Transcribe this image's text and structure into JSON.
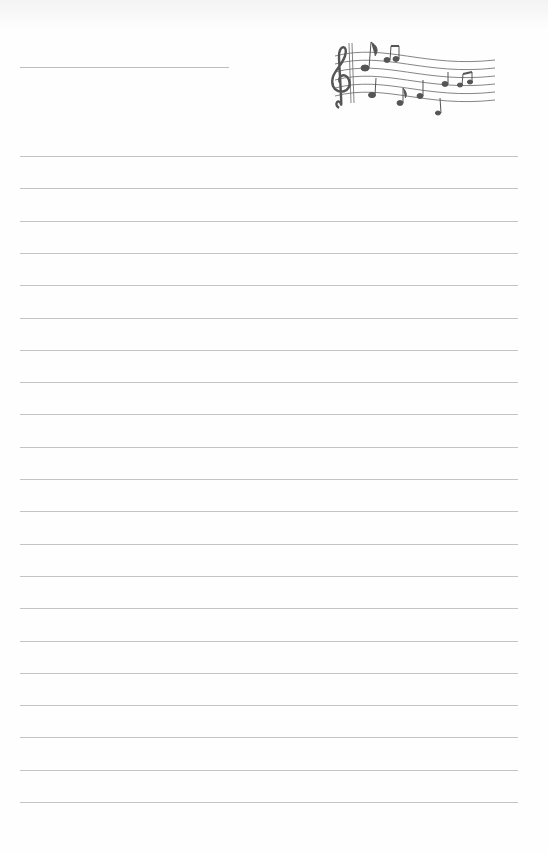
{
  "document": {
    "type": "lined-writing-paper",
    "decoration": "music-staff-with-notes-icon",
    "name_line": true,
    "rule_count": 21,
    "rule_color": "#c4c4c4",
    "ink_color": "#555555"
  }
}
